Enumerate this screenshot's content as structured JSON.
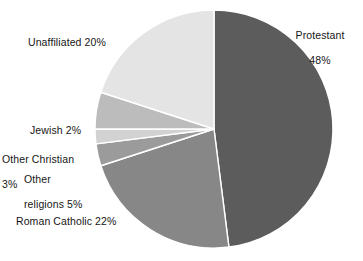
{
  "chart_data": {
    "type": "pie",
    "title": "",
    "legend_position": "none",
    "grid": false,
    "units": "percent",
    "categories": [
      "Protestant",
      "Roman Catholic",
      "Unaffiliated",
      "Other religions",
      "Other Christian",
      "Jewish"
    ],
    "values": [
      48,
      22,
      20,
      5,
      3,
      2
    ],
    "slices": [
      {
        "name": "Protestant",
        "label": "Protestant\n48%",
        "label_line1": "Protestant",
        "label_line2": "48%",
        "value": 48,
        "color": "#5c5c5c",
        "start_angle_deg": 0,
        "end_angle_deg": 172.8
      },
      {
        "name": "Roman Catholic",
        "label": "Roman Catholic 22%",
        "value": 22,
        "color": "#878787",
        "start_angle_deg": 172.8,
        "end_angle_deg": 252.0
      },
      {
        "name": "Other Christian",
        "label": "Other Christian\n3%",
        "label_line1": "Other Christian",
        "label_line2": "3%",
        "value": 3,
        "color": "#9b9b9b",
        "start_angle_deg": 252.0,
        "end_angle_deg": 262.8
      },
      {
        "name": "Jewish",
        "label": "Jewish 2%",
        "value": 2,
        "color": "#d2d2d2",
        "start_angle_deg": 262.8,
        "end_angle_deg": 270.0
      },
      {
        "name": "Other religions",
        "label": "Other\nreligions 5%",
        "label_line1": "Other",
        "label_line2": "religions 5%",
        "value": 5,
        "color": "#bcbcbc",
        "start_angle_deg": 270.0,
        "end_angle_deg": 288.0
      },
      {
        "name": "Unaffiliated",
        "label": "Unaffiliated 20%",
        "value": 20,
        "color": "#e4e4e4",
        "start_angle_deg": 288.0,
        "end_angle_deg": 360.0
      }
    ],
    "geometry": {
      "center_x": 214,
      "center_y": 129,
      "radius": 119,
      "separator_color": "#ffffff",
      "separator_width": 1.4
    },
    "background_color": "#ffffff",
    "text_color": "#161616"
  }
}
